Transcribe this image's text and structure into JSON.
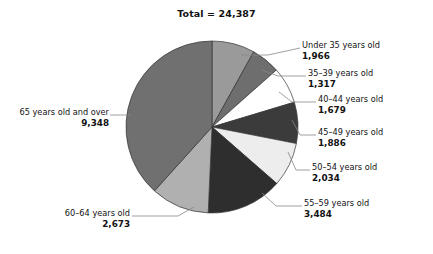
{
  "chart_data": {
    "type": "pie",
    "title": "Total = 24,387",
    "total": 24387,
    "total_label": "Total = 24,387",
    "xlabel": "",
    "ylabel": "",
    "legend_position": "callouts",
    "grid": false,
    "start_angle_deg": 0,
    "direction": "clockwise",
    "categories": [
      "Under 35 years old",
      "35–39 years old",
      "40–44 years old",
      "45–49 years old",
      "50–54 years old",
      "55–59 years old",
      "60–64 years old",
      "65 years old and over"
    ],
    "values": [
      1966,
      1317,
      1679,
      1886,
      2034,
      3484,
      2673,
      9348
    ],
    "value_labels": [
      "1,966",
      "1,317",
      "1,679",
      "1,886",
      "2,034",
      "3,484",
      "2,673",
      "9,348"
    ],
    "colors": [
      "#9a9a9a",
      "#6e6e6e",
      "#ffffff",
      "#3b3b3b",
      "#ededed",
      "#2e2e2e",
      "#b0b0b0",
      "#707070"
    ],
    "slices": [
      {
        "label": "Under 35 years old",
        "value": 1966,
        "value_label": "1,966",
        "color": "#9a9a9a",
        "side": "right"
      },
      {
        "label": "35–39 years old",
        "value": 1317,
        "value_label": "1,317",
        "color": "#6e6e6e",
        "side": "right"
      },
      {
        "label": "40–44 years old",
        "value": 1679,
        "value_label": "1,679",
        "color": "#ffffff",
        "side": "right"
      },
      {
        "label": "45–49 years old",
        "value": 1886,
        "value_label": "1,886",
        "color": "#3b3b3b",
        "side": "right"
      },
      {
        "label": "50–54 years old",
        "value": 2034,
        "value_label": "2,034",
        "color": "#ededed",
        "side": "right"
      },
      {
        "label": "55–59 years old",
        "value": 3484,
        "value_label": "3,484",
        "color": "#2e2e2e",
        "side": "right"
      },
      {
        "label": "60–64 years old",
        "value": 2673,
        "value_label": "2,673",
        "color": "#b0b0b0",
        "side": "left"
      },
      {
        "label": "65 years old and over",
        "value": 9348,
        "value_label": "9,348",
        "color": "#707070",
        "side": "left"
      }
    ]
  },
  "callouts": {
    "s0": {
      "cat": "Under 35 years old",
      "val": "1,966"
    },
    "s1": {
      "cat": "35–39 years old",
      "val": "1,317"
    },
    "s2": {
      "cat": "40–44 years old",
      "val": "1,679"
    },
    "s3": {
      "cat": "45–49 years old",
      "val": "1,886"
    },
    "s4": {
      "cat": "50–54 years old",
      "val": "2,034"
    },
    "s5": {
      "cat": "55–59 years old",
      "val": "3,484"
    },
    "s6": {
      "cat": "60–64 years old",
      "val": "2,673"
    },
    "s7": {
      "cat": "65 years old and over",
      "val": "9,348"
    }
  },
  "style": {
    "slice_outline": "#333333",
    "leader_line_color": "#888888",
    "background": "#ffffff",
    "text_color": "#111111"
  }
}
